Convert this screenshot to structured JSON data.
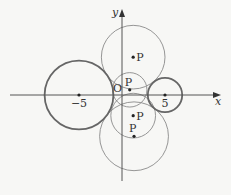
{
  "diagram": {
    "type": "coordinate-plane-circles",
    "axes": {
      "x_label": "x",
      "y_label": "y",
      "origin_label": "O"
    },
    "fixed_circles": [
      {
        "name": "left-circle",
        "center": [
          -5,
          0
        ],
        "radius": 4,
        "center_label": "−5",
        "emphasis": "thick"
      },
      {
        "name": "right-circle",
        "center": [
          5,
          0
        ],
        "radius": 2,
        "center_label": "5",
        "emphasis": "thick"
      }
    ],
    "moving_circles": [
      {
        "name": "circle-p-upper",
        "center": [
          1.3,
          4.4
        ],
        "radius": 3.7,
        "point_label": "P"
      },
      {
        "name": "circle-p-middle",
        "center": [
          0.9,
          0.6
        ],
        "radius": 2.0,
        "point_label": "P"
      },
      {
        "name": "circle-p-lower",
        "center": [
          1.3,
          -2.4
        ],
        "radius": 2.6,
        "point_label": "P"
      },
      {
        "name": "circle-p-lowest",
        "center": [
          1.4,
          -4.8
        ],
        "radius": 4.0,
        "point_label": "P"
      }
    ],
    "colors": {
      "background": "#f7f7f5",
      "axis": "#555555",
      "thick_circle": "#666666",
      "thin_circle": "#8a8a8a",
      "point": "#222222",
      "text": "#333333"
    }
  }
}
